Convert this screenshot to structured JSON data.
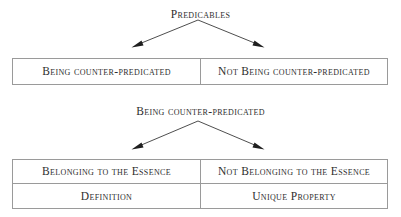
{
  "diagram": {
    "type": "taxonomy-tree",
    "root_label": "Predicables",
    "mid_label": "Being counter-predicated",
    "top_table": {
      "cells": [
        {
          "label": "Being counter-predicated"
        },
        {
          "label": "Not Being counter-predicated"
        }
      ]
    },
    "bottom_table": {
      "header_cells": [
        {
          "label": "Belonging to the Essence"
        },
        {
          "label": "Not Belonging to the Essence"
        }
      ],
      "body_cells": [
        {
          "label": "Definition"
        },
        {
          "label": "Unique Property"
        }
      ]
    },
    "colors": {
      "text": "#2e2e2e",
      "border": "#9a9a9a",
      "arrow": "#1f1f1f",
      "background": "#ffffff"
    }
  }
}
